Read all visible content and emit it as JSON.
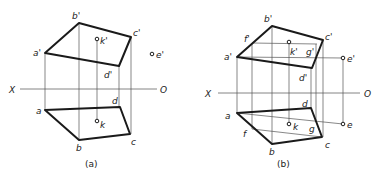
{
  "figures": [
    {
      "id": "a",
      "caption": "(a)",
      "axis": {
        "left_label": "X",
        "right_label": "O"
      },
      "labels": {
        "a_prime": "a'",
        "b_prime": "b'",
        "c_prime": "c'",
        "d_prime": "d'",
        "k_prime": "k'",
        "e_prime": "e'",
        "a": "a",
        "b": "b",
        "c": "c",
        "d": "d",
        "k": "k"
      }
    },
    {
      "id": "b",
      "caption": "(b)",
      "axis": {
        "left_label": "X",
        "right_label": "O"
      },
      "labels": {
        "a_prime": "a'",
        "b_prime": "b'",
        "c_prime": "c'",
        "d_prime": "d'",
        "k_prime": "k'",
        "e_prime": "e'",
        "f_prime": "f'",
        "g_prime": "g'",
        "a": "a",
        "b": "b",
        "c": "c",
        "d": "d",
        "k": "k",
        "e": "e",
        "f": "f",
        "g": "g"
      }
    }
  ]
}
